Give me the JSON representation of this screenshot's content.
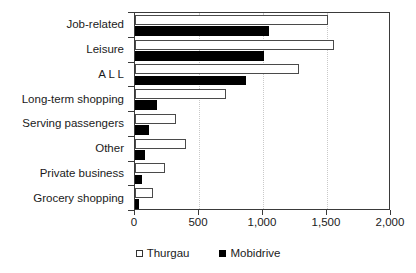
{
  "chart_data": {
    "type": "bar",
    "orientation": "horizontal",
    "title": "",
    "xlabel": "",
    "ylabel": "",
    "xlim": [
      0,
      2000
    ],
    "xticks": [
      0,
      500,
      1000,
      1500,
      2000
    ],
    "xtick_labels": [
      "0",
      "500",
      "1,000",
      "1,500",
      "2,000"
    ],
    "grid": true,
    "grid_axis": "x",
    "legend_position": "bottom",
    "categories": [
      "Job-related",
      "Leisure",
      "A L L",
      "Long-term shopping",
      "Serving passengers",
      "Other",
      "Private business",
      "Grocery shopping"
    ],
    "series": [
      {
        "name": "Thurgau",
        "color": "#ffffff",
        "edge_color": "#4a4a4a",
        "values": [
          1510,
          1555,
          1280,
          710,
          320,
          400,
          235,
          140
        ]
      },
      {
        "name": "Mobidrive",
        "color": "#000000",
        "edge_color": "#000000",
        "values": [
          1045,
          1010,
          865,
          170,
          110,
          80,
          55,
          33
        ]
      }
    ]
  },
  "legend": {
    "entries": [
      {
        "label": "Thurgau",
        "swatch": "open-square-swatch"
      },
      {
        "label": "Mobidrive",
        "swatch": "filled-square-swatch"
      }
    ]
  }
}
